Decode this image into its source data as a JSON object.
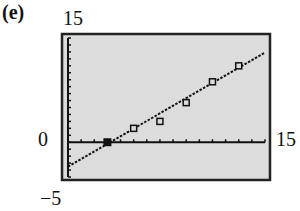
{
  "panel": {
    "label": "(e)"
  },
  "axes_labels": {
    "y_max": "15",
    "y_min": "−5",
    "x_zero": "0",
    "x_max": "15"
  },
  "colors": {
    "screen_bg": "#dcdcdc",
    "ink": "#111111",
    "border": "#222222"
  },
  "chart_data": {
    "type": "scatter",
    "title": "",
    "xlabel": "",
    "ylabel": "",
    "xlim": [
      0,
      15
    ],
    "ylim": [
      -5,
      15
    ],
    "x_tick_step": 1,
    "y_tick_step": 1,
    "grid": false,
    "series": [
      {
        "name": "data points",
        "marker": "open-square",
        "points": [
          [
            3,
            0
          ],
          [
            5,
            2
          ],
          [
            7,
            3
          ],
          [
            9,
            5.7
          ],
          [
            11,
            8.7
          ],
          [
            13,
            11
          ]
        ]
      },
      {
        "name": "regression line",
        "style": "dotted-line",
        "points": [
          [
            0,
            -3.5
          ],
          [
            15,
            12.9
          ]
        ]
      }
    ],
    "highlighted_point": {
      "x": 3,
      "y": 0,
      "marker": "filled-square"
    }
  }
}
